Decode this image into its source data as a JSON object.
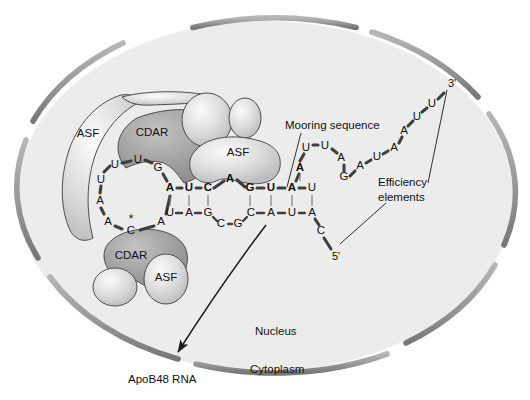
{
  "figure": {
    "compartments": {
      "nucleus_label": "Nucleus",
      "cytoplasm_label": "Cytoplasm"
    },
    "annotations": {
      "mooring": "Mooring sequence",
      "efficiency_line1": "Efficiency",
      "efficiency_line2": "elements",
      "product": "ApoB48 RNA"
    },
    "proteins": [
      {
        "id": "asf-upper-left",
        "label": "ASF",
        "x": 88,
        "y": 134,
        "kind": "crescent-light"
      },
      {
        "id": "cdar-upper",
        "label": "CDAR",
        "x": 152,
        "y": 133,
        "kind": "crescent-dark"
      },
      {
        "id": "asf-upper-right",
        "label": "ASF",
        "x": 238,
        "y": 153,
        "kind": "blob-light"
      },
      {
        "id": "cdar-lower",
        "label": "CDAR",
        "x": 131,
        "y": 256,
        "kind": "blob-dark"
      },
      {
        "id": "asf-lower",
        "label": "ASF",
        "x": 166,
        "y": 278,
        "kind": "blob-light"
      }
    ],
    "rna": {
      "edited_base_marker": "*",
      "five_prime": "5'",
      "three_prime": "3'",
      "hairpin_loop": [
        {
          "base": "U",
          "x": 115,
          "y": 165,
          "bold": false
        },
        {
          "base": "U",
          "x": 138,
          "y": 160,
          "bold": false
        },
        {
          "base": "G",
          "x": 158,
          "y": 168,
          "bold": false
        },
        {
          "base": "A",
          "x": 170,
          "y": 188,
          "bold": true
        },
        {
          "base": "A",
          "x": 161,
          "y": 222,
          "bold": false
        },
        {
          "base": "C",
          "x": 131,
          "y": 231,
          "bold": false
        },
        {
          "base": "A",
          "x": 108,
          "y": 222,
          "bold": false
        },
        {
          "base": "A",
          "x": 100,
          "y": 201,
          "bold": false
        },
        {
          "base": "U",
          "x": 101,
          "y": 180,
          "bold": false
        }
      ],
      "top_strand": [
        {
          "base": "A",
          "x": 170,
          "y": 188,
          "bold": true
        },
        {
          "base": "U",
          "x": 189,
          "y": 188,
          "bold": true
        },
        {
          "base": "C",
          "x": 208,
          "y": 188,
          "bold": true
        },
        {
          "base": "A",
          "x": 230,
          "y": 179,
          "bold": true
        },
        {
          "base": "G",
          "x": 250,
          "y": 188,
          "bold": true
        },
        {
          "base": "U",
          "x": 271,
          "y": 188,
          "bold": true
        },
        {
          "base": "A",
          "x": 292,
          "y": 188,
          "bold": true
        },
        {
          "base": "U",
          "x": 312,
          "y": 188,
          "bold": false
        }
      ],
      "bottom_strand": [
        {
          "base": "U",
          "x": 170,
          "y": 213,
          "bold": false
        },
        {
          "base": "A",
          "x": 189,
          "y": 213,
          "bold": false
        },
        {
          "base": "G",
          "x": 208,
          "y": 213,
          "bold": false
        },
        {
          "base": "C",
          "x": 221,
          "y": 224,
          "bold": false
        },
        {
          "base": "G",
          "x": 238,
          "y": 224,
          "bold": false
        },
        {
          "base": "C",
          "x": 251,
          "y": 213,
          "bold": false
        },
        {
          "base": "A",
          "x": 271,
          "y": 213,
          "bold": false
        },
        {
          "base": "U",
          "x": 292,
          "y": 213,
          "bold": false
        },
        {
          "base": "A",
          "x": 312,
          "y": 213,
          "bold": false
        }
      ],
      "five_prime_tail": [
        {
          "base": "C",
          "x": 321,
          "y": 231,
          "bold": false
        }
      ],
      "mooring_bulge": [
        {
          "base": "A",
          "x": 300,
          "y": 168,
          "bold": true
        },
        {
          "base": "U",
          "x": 306,
          "y": 148,
          "bold": false
        },
        {
          "base": "U",
          "x": 325,
          "y": 146,
          "bold": false
        },
        {
          "base": "A",
          "x": 341,
          "y": 158,
          "bold": false
        },
        {
          "base": "G",
          "x": 344,
          "y": 177,
          "bold": false
        }
      ],
      "three_prime_tail": [
        {
          "base": "A",
          "x": 360,
          "y": 166,
          "bold": false
        },
        {
          "base": "U",
          "x": 377,
          "y": 157,
          "bold": false
        },
        {
          "base": "A",
          "x": 394,
          "y": 148,
          "bold": false
        },
        {
          "base": "A",
          "x": 404,
          "y": 131,
          "bold": false
        },
        {
          "base": "U",
          "x": 417,
          "y": 117,
          "bold": false
        },
        {
          "base": "U",
          "x": 432,
          "y": 104,
          "bold": false
        }
      ]
    },
    "colors": {
      "background": "#ffffff",
      "nucleoplasm": "#ececec",
      "envelope": "#9a9a9a",
      "protein_light": "#d9d9d9",
      "protein_dark": "#9f9f9f",
      "rna_backbone": "#4a4a4a",
      "text": "#111111"
    }
  }
}
